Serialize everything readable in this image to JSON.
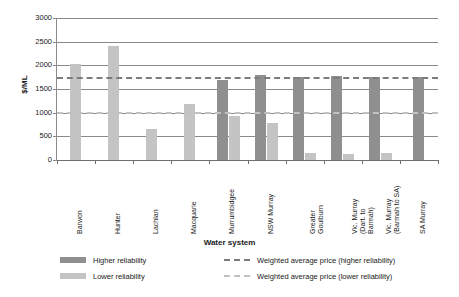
{
  "chart_data": {
    "type": "bar",
    "title": "",
    "xlabel": "Water system",
    "ylabel": "$/ML",
    "ylim": [
      0,
      3000
    ],
    "yticks": [
      0,
      500,
      1000,
      1500,
      2000,
      2500,
      3000
    ],
    "grid": true,
    "legend_position": "bottom",
    "categories": [
      "Barwon",
      "Hunter",
      "Lachlan",
      "Macquarie",
      "Murrumbidgee",
      "NSW Murray",
      "Greater\nGoulburn",
      "Vic. Murray\n(Dart. to\nBarmah)",
      "Vic. Murray\n(Barmah to SA)",
      "SA Murray"
    ],
    "series": [
      {
        "name": "Higher reliability",
        "color": "#8f8f8f",
        "values": [
          null,
          null,
          null,
          null,
          1700,
          1790,
          1760,
          1775,
          1760,
          1760
        ]
      },
      {
        "name": "Lower reliability",
        "color": "#c4c4c4",
        "values": [
          2030,
          2400,
          660,
          1190,
          930,
          790,
          140,
          125,
          155,
          null
        ]
      }
    ],
    "reference_lines": [
      {
        "name": "Weighted average price (higher reliability)",
        "value": 1760,
        "color": "#7c7c7c",
        "style": "dashed"
      },
      {
        "name": "Weighted average price (lower reliability)",
        "value": 1010,
        "color": "#c2c2c2",
        "style": "dashed"
      }
    ]
  },
  "axis": {
    "y_title": "$/ML",
    "x_title": "Water system",
    "y_ticks": [
      "3000",
      "2500",
      "2000",
      "1500",
      "1000",
      "500",
      "0"
    ]
  },
  "legend": {
    "bar_higher": "Higher reliability",
    "bar_lower": "Lower reliability",
    "line_higher": "Weighted average price (higher reliability)",
    "line_lower": "Weighted average price (lower reliability)"
  }
}
